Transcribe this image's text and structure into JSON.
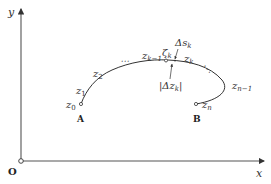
{
  "figure": {
    "axes": {
      "x_label": "x",
      "y_label": "y",
      "origin_label": "O"
    },
    "endpoints": {
      "start_label": "A",
      "end_label": "B"
    },
    "points": {
      "z0": {
        "base": "z",
        "sub": "0"
      },
      "z1": {
        "base": "z",
        "sub": "1"
      },
      "z2": {
        "base": "z",
        "sub": "2"
      },
      "zk_minus_1": {
        "base": "z",
        "sub": "k−1"
      },
      "zeta_k": {
        "base": "ζ",
        "sub": "k"
      },
      "zk": {
        "base": "z",
        "sub": "k"
      },
      "zn_minus_1": {
        "base": "z",
        "sub": "n−1"
      },
      "zn": {
        "base": "z",
        "sub": "n"
      }
    },
    "annotations": {
      "arc_length": {
        "base": "Δs",
        "sub": "k"
      },
      "chord_length": {
        "prefix": "|Δz",
        "sub": "k",
        "suffix": "|"
      },
      "ellipsis_left": "⋯",
      "ellipsis_right": "⋱"
    },
    "colors": {
      "axis": "#555555",
      "curve": "#333333",
      "text": "#333333"
    }
  }
}
